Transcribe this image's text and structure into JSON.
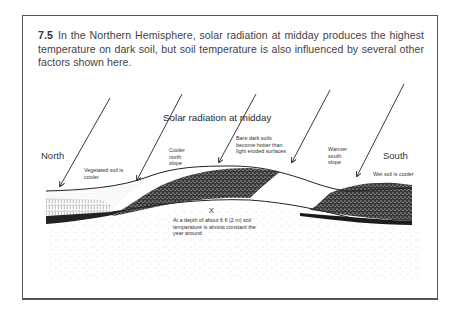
{
  "figure": {
    "number": "7.5",
    "caption": "In the Northern Hemisphere, solar radiation at midday produces the highest temperature on dark soil, but soil temperature is also influenced by several other factors shown here."
  },
  "diagram": {
    "title_label": "Solar radiation at midday",
    "directions": {
      "north": "North",
      "south": "South"
    },
    "annotations": {
      "vegetated": "Vegetated soil is cooler",
      "cooler_north_slope": "Cooler north slope",
      "bare_dark_soils": "Bare dark soils become hotter than light eroded surfaces",
      "warmer_south_slope": "Warmer south slope",
      "wet_soil": "Wet soil is cooler",
      "depth_marker": "X",
      "depth_note": "At a depth of about 6 ft (2 m) soil temperature is almost constant the year around"
    },
    "arrows_count": 5,
    "colors": {
      "ink": "#222222",
      "frame": "#555555",
      "background": "#ffffff"
    }
  }
}
